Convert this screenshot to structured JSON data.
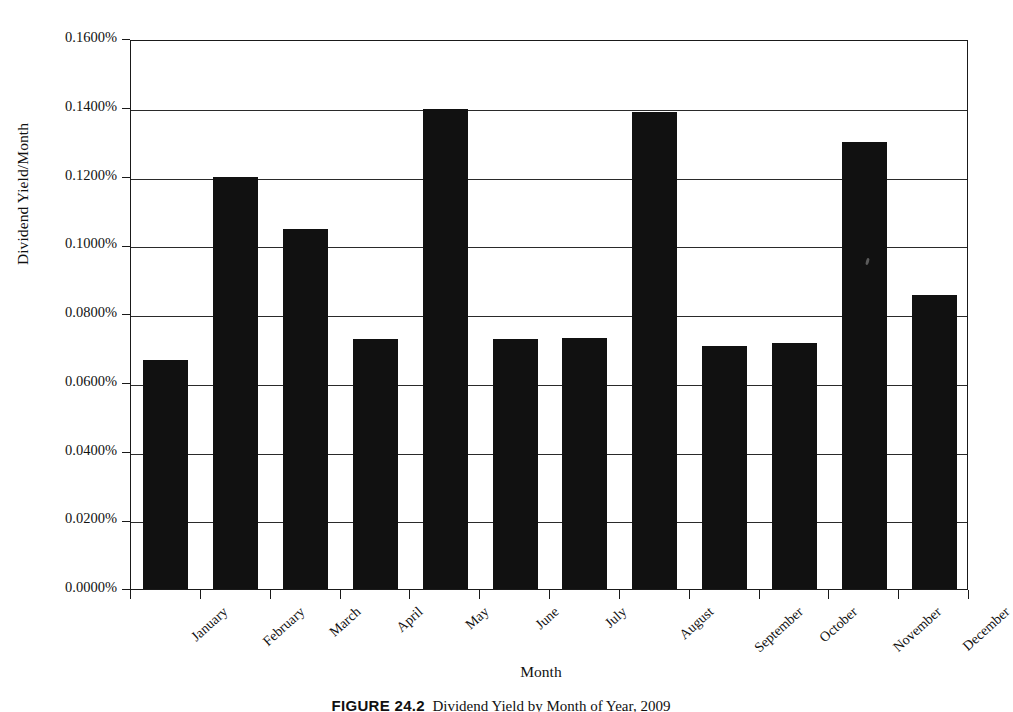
{
  "figure": {
    "y_axis_title": "Dividend Yield/Month",
    "x_axis_title": "Month",
    "caption_label": "FIGURE 24.2",
    "caption_text": "Dividend Yield by Month of Year, 2009"
  },
  "chart_data": {
    "type": "bar",
    "title": "",
    "xlabel": "Month",
    "ylabel": "Dividend Yield/Month",
    "categories": [
      "January",
      "February",
      "March",
      "April",
      "May",
      "June",
      "July",
      "August",
      "September",
      "October",
      "November",
      "December"
    ],
    "values": [
      0.0667,
      0.12,
      0.1048,
      0.0728,
      0.1396,
      0.0728,
      0.0729,
      0.1388,
      0.0707,
      0.0716,
      0.13,
      0.0855
    ],
    "value_unit": "percent",
    "ylim": [
      0.0,
      0.16
    ],
    "ytick_step": 0.02,
    "ytick_labels": [
      "0.0000%",
      "0.0200%",
      "0.0400%",
      "0.0600%",
      "0.0800%",
      "0.1000%",
      "0.1200%",
      "0.1400%",
      "0.1600%"
    ],
    "ytick_values": [
      0.0,
      0.02,
      0.04,
      0.06,
      0.08,
      0.1,
      0.12,
      0.14,
      0.16
    ],
    "grid": true,
    "grid_axis": "y",
    "legend": false,
    "bar_color": "#111111",
    "background_color": "#ffffff",
    "axis_color": "#1a1a1a"
  }
}
